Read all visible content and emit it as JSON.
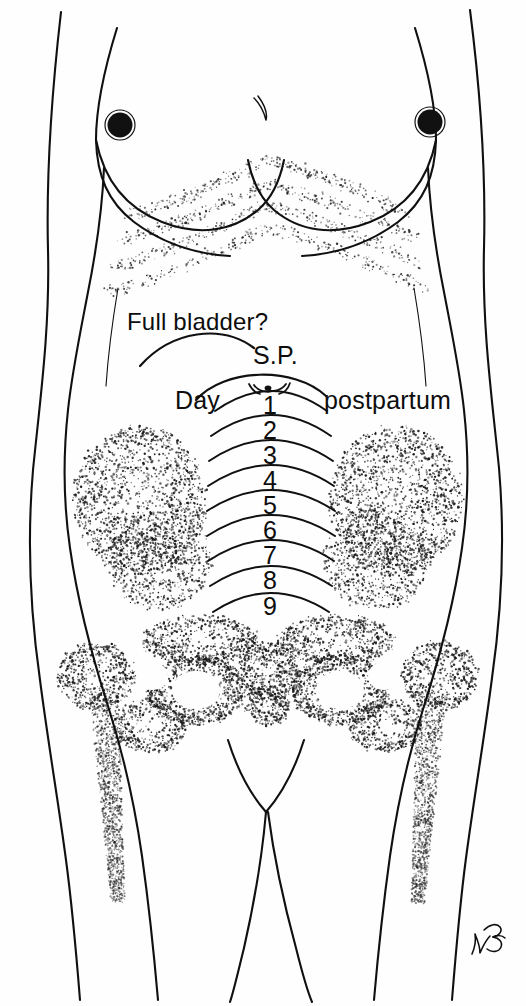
{
  "figure": {
    "name": "postpartum-fundal-height-diagram",
    "background_color": "#ffffff",
    "ink_color": "#101010"
  },
  "labels": {
    "full_bladder": "Full bladder?",
    "symphysis_pubis": "S.P.",
    "day": "Day",
    "postpartum": "postpartum"
  },
  "chart_data": {
    "type": "line",
    "title": "Day postpartum",
    "xlabel": "",
    "ylabel": "Fundal height",
    "categories": [
      "1",
      "2",
      "3",
      "4",
      "5",
      "6",
      "7",
      "8",
      "9"
    ],
    "values": [
      1,
      2,
      3,
      4,
      5,
      6,
      7,
      8,
      9
    ],
    "annotations": [
      "Full bladder?",
      "S.P."
    ],
    "grid": false,
    "legend": "none"
  },
  "fundal_arcs": [
    {
      "day": "1",
      "number_x": 262,
      "number_y": 393,
      "arc_y": 411,
      "half_width": 56,
      "rise": 20
    },
    {
      "day": "2",
      "number_x": 262,
      "number_y": 418,
      "arc_y": 436,
      "half_width": 60,
      "rise": 21
    },
    {
      "day": "3",
      "number_x": 262,
      "number_y": 443,
      "arc_y": 461,
      "half_width": 62,
      "rise": 21
    },
    {
      "day": "4",
      "number_x": 262,
      "number_y": 468,
      "arc_y": 486,
      "half_width": 63,
      "rise": 21
    },
    {
      "day": "5",
      "number_x": 262,
      "number_y": 493,
      "arc_y": 511,
      "half_width": 64,
      "rise": 21
    },
    {
      "day": "6",
      "number_x": 262,
      "number_y": 518,
      "arc_y": 536,
      "half_width": 64,
      "rise": 21
    },
    {
      "day": "7",
      "number_x": 262,
      "number_y": 543,
      "arc_y": 561,
      "half_width": 63,
      "rise": 21
    },
    {
      "day": "8",
      "number_x": 262,
      "number_y": 568,
      "arc_y": 586,
      "half_width": 61,
      "rise": 20
    },
    {
      "day": "9",
      "number_x": 262,
      "number_y": 594,
      "arc_y": 612,
      "half_width": 58,
      "rise": 19
    }
  ],
  "anatomy": {
    "umbilicus": "navel",
    "breasts": "two",
    "nipples": "two",
    "rib_cage": "stippled costal margin",
    "pelvis": "stippled ilium, ischium, pubis, sacrum",
    "femurs": "two stippled proximal femurs"
  },
  "signature": {
    "present": true,
    "description": "artist monogram lower right"
  }
}
